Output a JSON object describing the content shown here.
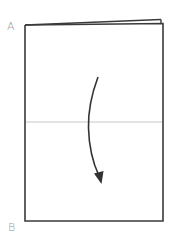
{
  "diagram": {
    "title": "",
    "labels": {
      "top_left": "A",
      "bottom_left": "B"
    },
    "paper": {
      "edge_color": "#3a3a3a",
      "fill_color": "#ffffff"
    },
    "fold_line": {
      "color": "#c8c8c8",
      "description": "horizontal crease at middle"
    },
    "arrow": {
      "color": "#333333",
      "direction": "down",
      "description": "curved arrow indicating fold from top to bottom"
    }
  }
}
